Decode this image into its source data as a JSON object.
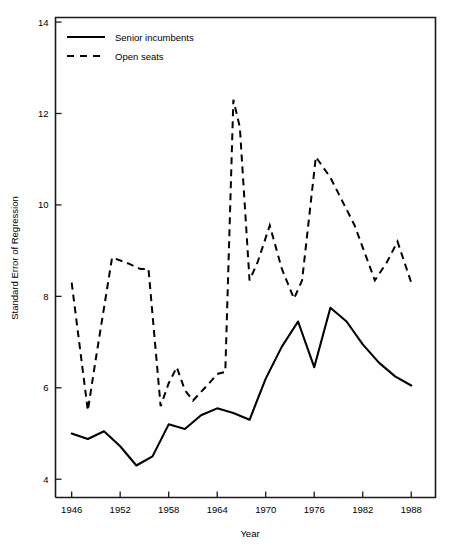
{
  "chart_data": {
    "type": "line",
    "title": "",
    "xlabel": "Year",
    "ylabel": "Standard Error of Regression",
    "xlim": [
      1944,
      1991
    ],
    "ylim": [
      3.6,
      14.1
    ],
    "xticks": [
      1946,
      1952,
      1958,
      1964,
      1970,
      1976,
      1982,
      1988
    ],
    "yticks": [
      4,
      6,
      8,
      10,
      12,
      14
    ],
    "grid": false,
    "legend_position": "top-left",
    "x": [
      1946,
      1948,
      1950,
      1952,
      1954,
      1956,
      1958,
      1960,
      1962,
      1964,
      1966,
      1968,
      1970,
      1972,
      1974,
      1976,
      1978,
      1980,
      1982,
      1984,
      1986,
      1988
    ],
    "series": [
      {
        "name": "Senior incumbents",
        "style": "solid",
        "color": "#000000",
        "values": [
          5.0,
          4.88,
          5.05,
          4.72,
          4.3,
          4.5,
          5.2,
          5.1,
          5.4,
          5.55,
          5.45,
          5.3,
          6.2,
          6.9,
          7.45,
          6.45,
          7.75,
          7.45,
          6.95,
          6.55,
          6.25,
          6.05
        ]
      },
      {
        "name": "Open seats",
        "style": "dashed",
        "color": "#000000",
        "values": [
          8.3,
          5.5,
          6.65,
          8.85,
          8.75,
          8.6,
          5.6,
          6.1,
          6.45,
          5.75,
          5.9,
          6.1,
          6.3,
          6.35,
          12.3,
          11.7,
          8.35,
          9.05,
          9.55,
          8.75,
          8.3,
          7.95
        ]
      }
    ],
    "series_dashed_detail": {
      "name": "Open seats",
      "points": [
        [
          1946,
          8.3
        ],
        [
          1948,
          5.5
        ],
        [
          1949,
          6.65
        ],
        [
          1951,
          8.85
        ],
        [
          1953,
          8.72
        ],
        [
          1954.5,
          8.6
        ],
        [
          1955.5,
          8.6
        ],
        [
          1957,
          5.6
        ],
        [
          1958,
          6.1
        ],
        [
          1959,
          6.45
        ],
        [
          1960,
          5.95
        ],
        [
          1961,
          5.72
        ],
        [
          1963,
          6.1
        ],
        [
          1964,
          6.3
        ],
        [
          1965,
          6.35
        ],
        [
          1966,
          12.3
        ],
        [
          1966.8,
          11.7
        ],
        [
          1968,
          8.35
        ],
        [
          1969,
          8.75
        ],
        [
          1970.5,
          9.55
        ],
        [
          1972,
          8.6
        ],
        [
          1973.5,
          7.95
        ],
        [
          1974.5,
          8.35
        ],
        [
          1976.2,
          11.05
        ],
        [
          1978,
          10.6
        ],
        [
          1981,
          9.55
        ],
        [
          1983.5,
          8.35
        ],
        [
          1985,
          8.75
        ],
        [
          1986.3,
          9.2
        ],
        [
          1988,
          8.3
        ]
      ]
    },
    "series_solid_detail": {
      "name": "Senior incumbents",
      "points": [
        [
          1946,
          5.0
        ],
        [
          1948,
          4.88
        ],
        [
          1950,
          5.05
        ],
        [
          1952,
          4.72
        ],
        [
          1954,
          4.3
        ],
        [
          1956,
          4.5
        ],
        [
          1958,
          5.2
        ],
        [
          1960,
          5.1
        ],
        [
          1962,
          5.4
        ],
        [
          1964,
          5.55
        ],
        [
          1966,
          5.45
        ],
        [
          1968,
          5.3
        ],
        [
          1970,
          6.2
        ],
        [
          1972,
          6.9
        ],
        [
          1974,
          7.45
        ],
        [
          1976,
          6.45
        ],
        [
          1978,
          7.75
        ],
        [
          1980,
          7.45
        ],
        [
          1982,
          6.95
        ],
        [
          1984,
          6.55
        ],
        [
          1986,
          6.25
        ],
        [
          1988,
          6.05
        ]
      ]
    }
  },
  "axes": {
    "x_tick_labels": [
      "1946",
      "1952",
      "1958",
      "1964",
      "1970",
      "1976",
      "1982",
      "1988"
    ],
    "y_tick_labels": [
      "4",
      "6",
      "8",
      "10",
      "12",
      "14"
    ],
    "x_axis_title": "Year",
    "y_axis_title": "Standard Error of Regression"
  },
  "legend": {
    "entries": [
      {
        "label": "Senior incumbents",
        "style": "solid"
      },
      {
        "label": "Open seats",
        "style": "dashed"
      }
    ]
  },
  "colors": {
    "ink": "#000000",
    "axis": "#1a1a1a",
    "background": "#ffffff"
  }
}
